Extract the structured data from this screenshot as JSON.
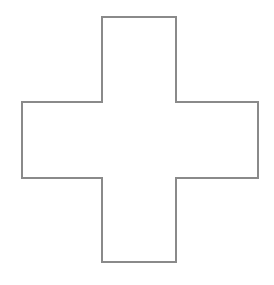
{
  "diagram": {
    "shape": "cross",
    "stroke_color": "#8a8a8a",
    "fill_color": "#ffffff",
    "stroke_width": 2,
    "points": "102,17 176,17 176,102 258,102 258,178 176,178 176,262 102,262 102,178 22,178 22,102 102,102"
  }
}
